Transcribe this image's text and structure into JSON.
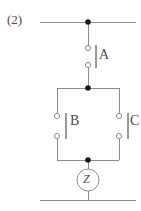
{
  "figure": {
    "number_label": "(2)",
    "type": "switching-circuit-schematic"
  },
  "components": [
    {
      "id": "A",
      "label": "A",
      "kind": "switch",
      "state": "open",
      "topology": "series",
      "contacts": 2
    },
    {
      "id": "B",
      "label": "B",
      "kind": "switch",
      "state": "open",
      "topology": "parallel-left",
      "contacts": 2
    },
    {
      "id": "C",
      "label": "C",
      "kind": "switch",
      "state": "open",
      "topology": "parallel-right",
      "contacts": 2
    },
    {
      "id": "Z",
      "label": "Z",
      "kind": "element-circle",
      "topology": "series"
    }
  ],
  "nodes": [
    {
      "id": "top-supply-node",
      "x": 88,
      "y": 22
    },
    {
      "id": "parallel-top-node",
      "x": 88,
      "y": 88
    },
    {
      "id": "parallel-bottom-node",
      "x": 88,
      "y": 160
    }
  ],
  "rails": {
    "top": {
      "y": 22,
      "x1": 40,
      "x2": 136
    },
    "bottom": {
      "y": 200,
      "x1": 40,
      "x2": 136
    }
  },
  "colors": {
    "wire": "#8c8c8c",
    "node": "#1a1a1a",
    "text": "#4a4a4a",
    "background": "#ffffff"
  }
}
